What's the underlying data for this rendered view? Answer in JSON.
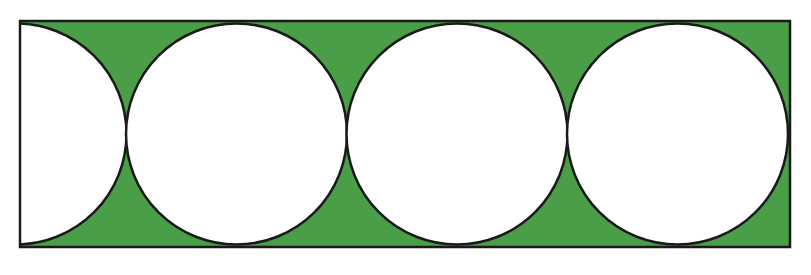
{
  "figure": {
    "colors": {
      "shaded_region": "#4a9e47",
      "circle_fill": "#ffffff",
      "stroke": "#1a1a1a",
      "background": "#ffffff"
    },
    "rectangle": {
      "x": 20,
      "y": 21,
      "width": 770,
      "height": 226
    },
    "circles": [
      {
        "label": "half-circle",
        "cx": 16,
        "cy": 134,
        "r": 110.5
      },
      {
        "label": "circle-1",
        "cx": 236.5,
        "cy": 134,
        "r": 110.5
      },
      {
        "label": "circle-2",
        "cx": 457,
        "cy": 134,
        "r": 110.5
      },
      {
        "label": "circle-3",
        "cx": 677.5,
        "cy": 134,
        "r": 110.5
      }
    ]
  }
}
